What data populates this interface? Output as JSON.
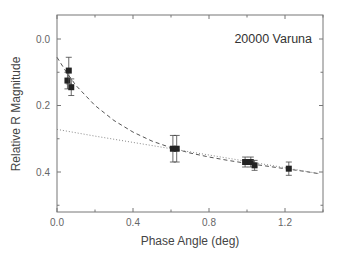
{
  "chart_data": {
    "type": "scatter",
    "title": "20000  Varuna",
    "xlabel": "Phase Angle (deg)",
    "ylabel": "Relative R Magnitude",
    "xlim": [
      0.0,
      1.4
    ],
    "ylim": [
      0.52,
      -0.07
    ],
    "y_inverted": true,
    "x_ticks": [
      0.0,
      0.4,
      0.8,
      1.2
    ],
    "x_tick_labels": [
      "0.0",
      "0.4",
      "0.8",
      "1.2"
    ],
    "y_ticks": [
      0.0,
      0.2,
      0.4
    ],
    "y_tick_labels": [
      "0.0",
      "0.2",
      "0.4"
    ],
    "grid": false,
    "legend": null,
    "series": [
      {
        "name": "observations",
        "marker": "square",
        "color": "#222222",
        "x": [
          0.055,
          0.062,
          0.075,
          0.61,
          0.63,
          0.99,
          1.02,
          1.04,
          1.22
        ],
        "y": [
          0.125,
          0.095,
          0.145,
          0.33,
          0.33,
          0.37,
          0.37,
          0.38,
          0.39
        ],
        "yerr": [
          0.025,
          0.04,
          0.025,
          0.04,
          0.04,
          0.015,
          0.015,
          0.015,
          0.02
        ]
      },
      {
        "name": "dashed fit (opposition surge)",
        "style": "dashed",
        "color": "#555555",
        "x": [
          0.0,
          0.05,
          0.1,
          0.2,
          0.3,
          0.4,
          0.5,
          0.6,
          0.7,
          0.8,
          0.9,
          1.0,
          1.1,
          1.2,
          1.3,
          1.38
        ],
        "y": [
          0.055,
          0.1,
          0.14,
          0.2,
          0.245,
          0.28,
          0.307,
          0.327,
          0.343,
          0.355,
          0.365,
          0.374,
          0.382,
          0.39,
          0.398,
          0.405
        ]
      },
      {
        "name": "dotted linear fit",
        "style": "dotted",
        "color": "#888888",
        "x": [
          0.0,
          0.2,
          0.4,
          0.6,
          0.8,
          1.0,
          1.2,
          1.38
        ],
        "y": [
          0.272,
          0.292,
          0.311,
          0.33,
          0.349,
          0.368,
          0.387,
          0.405
        ]
      }
    ]
  }
}
